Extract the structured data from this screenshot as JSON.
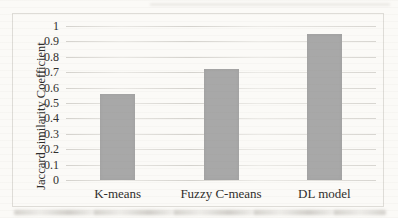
{
  "figure": {
    "kind": "scanned-bar-chart",
    "colors": {
      "page_background": "#fbfaf7",
      "bar_fill": "#a8a8a8",
      "gridline": "#b4b1aa",
      "frame_border": "#dedcd7",
      "text": "#2f2e2c"
    }
  },
  "chart_data": {
    "type": "bar",
    "categories": [
      "K-means",
      "Fuzzy C-means",
      "DL model"
    ],
    "values": [
      0.56,
      0.72,
      0.95
    ],
    "title": "",
    "xlabel": "",
    "ylabel": "Jaccard similarity Coefficient",
    "ylim": [
      0,
      1
    ],
    "yticks": [
      {
        "value": 1,
        "label": "1"
      },
      {
        "value": 0.9,
        "label": "0.9"
      },
      {
        "value": 0.8,
        "label": "0.8"
      },
      {
        "value": 0.7,
        "label": "0.7"
      },
      {
        "value": 0.6,
        "label": "0.6"
      },
      {
        "value": 0.5,
        "label": "0.5"
      },
      {
        "value": 0.4,
        "label": "0.4"
      },
      {
        "value": 0.3,
        "label": "0.3"
      },
      {
        "value": 0.2,
        "label": "0.2"
      },
      {
        "value": 0.1,
        "label": "0.1"
      },
      {
        "value": 0,
        "label": "0"
      }
    ],
    "grid": "horizontal",
    "legend": "none",
    "bar_color": "#a8a8a8"
  }
}
